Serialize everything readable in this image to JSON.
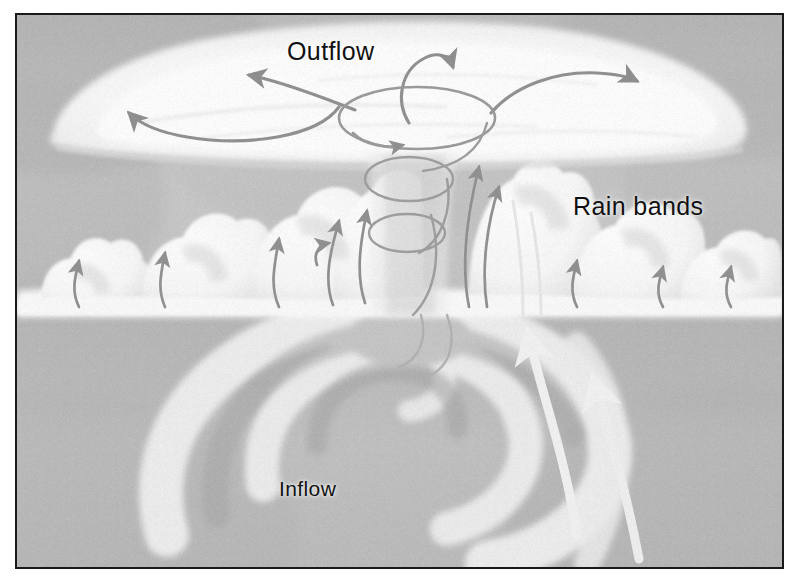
{
  "figure": {
    "kind": "diagram",
    "style": "grayscale airbrush / pencil illustration, speckled halftone texture, thin black rectangular frame",
    "frame_color": "#1a1a1a",
    "background_color": "#ffffff"
  },
  "labels": {
    "outflow": "Outflow",
    "rain_bands": "Rain bands",
    "inflow": "Inflow"
  },
  "palette": {
    "sky_gray": "#a8a8a8",
    "sky_dark_gray": "#8f8f8f",
    "cloud_white": "#fbfbfb",
    "cloud_shadow": "#c9c9c9",
    "sea_gray": "#9c9c9c",
    "sea_dark": "#7c7c7c",
    "spiral_light": "#e8e8e8",
    "arrow_dark": "#5a5a5a",
    "arrow_light": "#ededed",
    "text_color": "#111111"
  },
  "regions": [
    {
      "name": "anvil-outflow-cloud",
      "description": "Broad white cirrus anvil canopy spreading across the top of the storm"
    },
    {
      "name": "eyewall-and-eye",
      "description": "Central funnel-shaped clear eye with stacked elliptical rings showing sinking, rotating air"
    },
    {
      "name": "rain-band-cloud-towers",
      "description": "Row of white cumulonimbus towers on both sides of the eyewall"
    },
    {
      "name": "sea-surface-spiral",
      "description": "Spiral inflow bands converging on the storm center over the ocean surface"
    }
  ],
  "arrows": {
    "outflow": {
      "count": 4,
      "direction": "outward from storm top, both left and right",
      "color": "#5a5a5a",
      "style": "thin curved pencil arrows with solid heads"
    },
    "eye_circulation": {
      "count": 3,
      "direction": "clockwise loop over the eye plus two stacked rings descending inside the eye",
      "color": "#5a5a5a"
    },
    "updraft": {
      "count": 11,
      "direction": "upward through the cumulus towers and eyewall",
      "color": "#5a5a5a"
    },
    "inflow": {
      "count": 2,
      "direction": "upward/inward along the sea surface toward the eyewall",
      "color": "#ededed",
      "style": "thick light curved arrows"
    }
  }
}
